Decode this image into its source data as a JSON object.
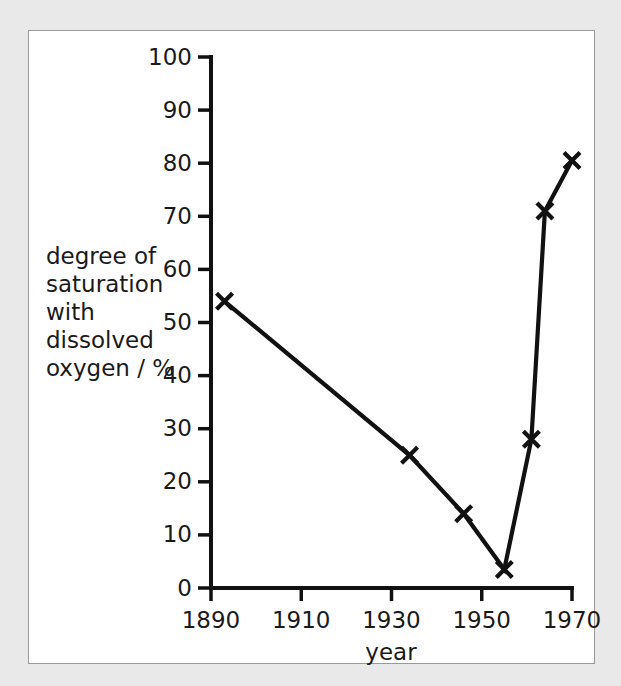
{
  "figure": {
    "background_color": "#e9e9e9",
    "panel_color": "#ffffff",
    "border_color": "#9a9a9a",
    "ink_color": "#111111"
  },
  "chart_data": {
    "type": "line",
    "title": "",
    "subtitle": "",
    "xlabel": "year",
    "ylabel": "degree of saturation with dissolved oxygen / %",
    "ylabel_lines": [
      "degree of",
      "saturation",
      "with",
      "dissolved",
      "oxygen / %"
    ],
    "xlim": [
      1890,
      1970
    ],
    "ylim": [
      0,
      100
    ],
    "xticks": [
      1890,
      1910,
      1930,
      1950,
      1970
    ],
    "xtick_labels": [
      "1890",
      "1910",
      "1930",
      "1950",
      "1970"
    ],
    "yticks": [
      0,
      10,
      20,
      30,
      40,
      50,
      60,
      70,
      80,
      90,
      100
    ],
    "ytick_labels": [
      "0",
      "10",
      "20",
      "30",
      "40",
      "50",
      "60",
      "70",
      "80",
      "90",
      "100"
    ],
    "grid": false,
    "legend": false,
    "marker": "x",
    "x": [
      1893,
      1934,
      1946,
      1955,
      1961,
      1964,
      1970
    ],
    "values": [
      54,
      25,
      14,
      3.5,
      28,
      71,
      80.5
    ],
    "series": [
      {
        "name": "degree of saturation with dissolved oxygen",
        "x": [
          1893,
          1934,
          1946,
          1955,
          1961,
          1964,
          1970
        ],
        "values": [
          54,
          25,
          14,
          3.5,
          28,
          71,
          80.5
        ]
      }
    ],
    "annotations": []
  }
}
